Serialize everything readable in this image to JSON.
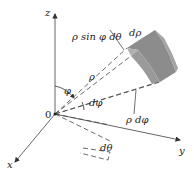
{
  "figure": {
    "type": "spherical-coordinates-volume-element",
    "axes": {
      "z_label": "z",
      "x_label": "x",
      "y_label": "y",
      "origin_label": "0"
    },
    "labels": {
      "rho_sin_phi_dtheta": "ρ sin φ dθ",
      "d_rho": "dρ",
      "phi": "φ",
      "rho": "ρ",
      "d_phi": "dφ",
      "rho_d_phi": "ρ dφ",
      "d_theta": "dθ"
    },
    "colors": {
      "axis": "#555555",
      "dashed": "#444444",
      "block_front": "#8c8c8c",
      "block_side": "#a3a3a3",
      "block_top": "#b5b5b5",
      "text": "#222222",
      "background": "#ffffff"
    }
  }
}
